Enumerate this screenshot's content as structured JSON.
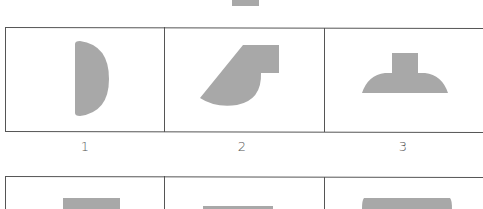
{
  "figure": {
    "shape_fill": "#a8a8a8",
    "border_color": "#555555",
    "top_row": {
      "options": [
        {
          "label": "1",
          "shape": "half-disc-D"
        },
        {
          "label": "2",
          "shape": "slanted-block-with-arc"
        },
        {
          "label": "3",
          "shape": "dome-with-stem"
        }
      ]
    },
    "bottom_row": {
      "options": [
        {
          "shape": "partial-rectangle"
        },
        {
          "shape": "partial-rectangle"
        },
        {
          "shape": "partial-rounded-rectangle"
        }
      ]
    }
  }
}
